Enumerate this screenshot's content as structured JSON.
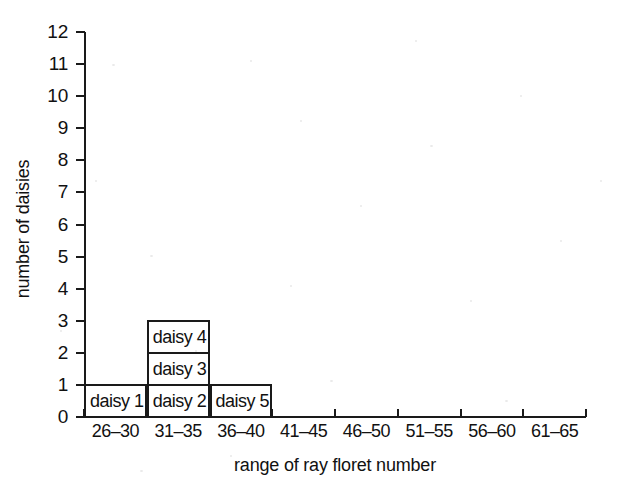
{
  "chart_data": {
    "type": "bar",
    "title": "",
    "subtitle": "",
    "xlabel": "range of ray floret number",
    "ylabel": "number of daisies",
    "categories": [
      "26–30",
      "31–35",
      "36–40",
      "41–45",
      "46–50",
      "51–55",
      "56–60",
      "61–65"
    ],
    "values": [
      1,
      3,
      1,
      0,
      0,
      0,
      0,
      0
    ],
    "stacked": true,
    "series": [
      {
        "name": "daisy count per range",
        "values": [
          1,
          3,
          1,
          0,
          0,
          0,
          0,
          0
        ]
      }
    ],
    "segment_labels": [
      [
        "daisy 1"
      ],
      [
        "daisy 2",
        "daisy 3",
        "daisy 4"
      ],
      [
        "daisy 5"
      ],
      [],
      [],
      [],
      [],
      []
    ],
    "xlim": [
      0,
      8
    ],
    "ylim": [
      0,
      12
    ],
    "ytick_labels": [
      "0",
      "1",
      "2",
      "3",
      "4",
      "5",
      "6",
      "7",
      "8",
      "9",
      "10",
      "11",
      "12"
    ],
    "ytick_values": [
      0,
      1,
      2,
      3,
      4,
      5,
      6,
      7,
      8,
      9,
      10,
      11,
      12
    ],
    "grid": false,
    "legend": false,
    "legend_position": "none",
    "bar_fill_color": "#ffffff",
    "bar_edge_color": "#1a1a1a",
    "axis_color": "#1a1a1a",
    "background_color": "#ffffff"
  }
}
